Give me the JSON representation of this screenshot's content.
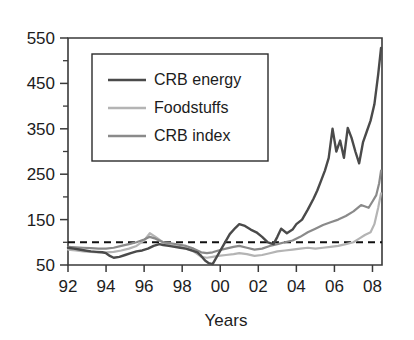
{
  "chart_data": {
    "type": "line",
    "title": "",
    "subtitle": "",
    "xlabel": "Years",
    "ylabel": "",
    "xlim": [
      1992,
      2008.5
    ],
    "ylim": [
      50,
      550
    ],
    "grid": false,
    "legend_position": "top-left-inside",
    "y_ticks_major": [
      50,
      150,
      250,
      350,
      450,
      550
    ],
    "y_ticks_minor": [
      100,
      200,
      300,
      400,
      500
    ],
    "y_tick_labels": [
      "50",
      "150",
      "250",
      "350",
      "450",
      "550"
    ],
    "x_ticks": [
      1992,
      1994,
      1996,
      1998,
      2000,
      2002,
      2004,
      2006,
      2008
    ],
    "x_tick_labels": [
      "92",
      "94",
      "96",
      "98",
      "00",
      "02",
      "04",
      "06",
      "08"
    ],
    "reference_line": {
      "value": 100,
      "style": "dashed",
      "color": "#111111"
    },
    "colors": {
      "crb_energy": "#4a4a4a",
      "foodstuffs": "#b4b4b4",
      "crb_index": "#8a8a8a",
      "axis": "#3a3a3a",
      "text": "#1c1c1c",
      "background": "#ffffff"
    },
    "series": [
      {
        "name": "CRB energy",
        "color": "#4a4a4a",
        "x": [
          1992.0,
          1992.3,
          1992.6,
          1992.9,
          1993.2,
          1993.5,
          1993.8,
          1994.0,
          1994.2,
          1994.4,
          1994.7,
          1995.0,
          1995.3,
          1995.6,
          1995.9,
          1996.2,
          1996.5,
          1996.8,
          1997.0,
          1997.3,
          1997.6,
          1997.9,
          1998.2,
          1998.5,
          1998.8,
          1999.0,
          1999.2,
          1999.4,
          1999.6,
          1999.9,
          2000.2,
          2000.5,
          2000.8,
          2001.0,
          2001.3,
          2001.6,
          2001.9,
          2002.2,
          2002.5,
          2002.8,
          2003.0,
          2003.2,
          2003.5,
          2003.8,
          2004.0,
          2004.3,
          2004.6,
          2004.9,
          2005.1,
          2005.3,
          2005.5,
          2005.7,
          2005.9,
          2006.1,
          2006.3,
          2006.5,
          2006.7,
          2006.9,
          2007.1,
          2007.3,
          2007.5,
          2007.7,
          2007.9,
          2008.1,
          2008.3,
          2008.45
        ],
        "y": [
          88,
          86,
          84,
          82,
          80,
          79,
          78,
          76,
          70,
          66,
          68,
          72,
          76,
          80,
          82,
          86,
          92,
          96,
          94,
          92,
          90,
          88,
          86,
          82,
          78,
          70,
          60,
          54,
          52,
          74,
          96,
          118,
          132,
          140,
          136,
          128,
          122,
          112,
          100,
          96,
          112,
          130,
          120,
          128,
          140,
          150,
          172,
          196,
          214,
          236,
          258,
          286,
          350,
          300,
          324,
          286,
          352,
          330,
          300,
          274,
          320,
          344,
          368,
          404,
          470,
          528
        ]
      },
      {
        "name": "Foodstuffs",
        "color": "#b4b4b4",
        "x": [
          1992.0,
          1992.4,
          1992.8,
          1993.2,
          1993.6,
          1994.0,
          1994.4,
          1994.8,
          1995.2,
          1995.6,
          1996.0,
          1996.3,
          1996.6,
          1997.0,
          1997.4,
          1997.8,
          1998.2,
          1998.6,
          1999.0,
          1999.3,
          1999.6,
          1999.9,
          2000.3,
          2000.7,
          2001.0,
          2001.4,
          2001.8,
          2002.2,
          2002.6,
          2003.0,
          2003.4,
          2003.8,
          2004.2,
          2004.6,
          2005.0,
          2005.4,
          2005.8,
          2006.2,
          2006.6,
          2007.0,
          2007.3,
          2007.6,
          2007.9,
          2008.1,
          2008.3,
          2008.45
        ],
        "y": [
          84,
          82,
          80,
          79,
          78,
          78,
          79,
          82,
          86,
          92,
          104,
          120,
          112,
          100,
          94,
          90,
          86,
          80,
          68,
          66,
          68,
          70,
          72,
          74,
          76,
          74,
          70,
          72,
          76,
          80,
          82,
          84,
          86,
          88,
          86,
          88,
          90,
          92,
          96,
          100,
          108,
          116,
          122,
          140,
          176,
          208
        ]
      },
      {
        "name": "CRB index",
        "color": "#8a8a8a",
        "x": [
          1992.0,
          1992.4,
          1992.8,
          1993.2,
          1993.6,
          1994.0,
          1994.4,
          1994.8,
          1995.2,
          1995.6,
          1996.0,
          1996.3,
          1996.6,
          1997.0,
          1997.4,
          1997.8,
          1998.2,
          1998.6,
          1999.0,
          1999.3,
          1999.6,
          1999.9,
          2000.3,
          2000.7,
          2001.0,
          2001.4,
          2001.8,
          2002.2,
          2002.6,
          2003.0,
          2003.4,
          2003.8,
          2004.2,
          2004.6,
          2005.0,
          2005.4,
          2005.8,
          2006.2,
          2006.6,
          2007.0,
          2007.4,
          2007.8,
          2008.0,
          2008.2,
          2008.35,
          2008.45
        ],
        "y": [
          90,
          89,
          88,
          87,
          86,
          86,
          88,
          92,
          96,
          100,
          106,
          112,
          108,
          100,
          98,
          95,
          92,
          86,
          78,
          76,
          78,
          82,
          86,
          90,
          92,
          88,
          84,
          86,
          92,
          96,
          100,
          104,
          112,
          122,
          130,
          138,
          144,
          150,
          158,
          168,
          182,
          176,
          190,
          204,
          230,
          258
        ]
      }
    ]
  },
  "axes": {
    "x_title": "Years",
    "y_title": ""
  },
  "legend": {
    "entries": [
      {
        "label": "CRB energy",
        "color": "#4a4a4a"
      },
      {
        "label": "Foodstuffs",
        "color": "#b4b4b4"
      },
      {
        "label": "CRB index",
        "color": "#8a8a8a"
      }
    ]
  }
}
